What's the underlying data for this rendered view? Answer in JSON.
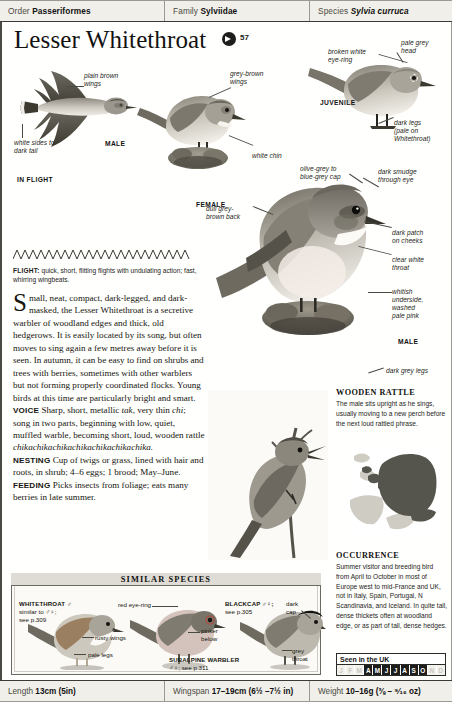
{
  "taxonomy": {
    "order_label": "Order",
    "order_value": "Passeriformes",
    "family_label": "Family",
    "family_value": "Sylviidae",
    "species_label": "Species",
    "species_value": "Sylvia curruca"
  },
  "title": "Lesser Whitethroat",
  "audio": {
    "icon": "speaker-icon",
    "track_number": "57"
  },
  "annotations": {
    "plain_brown_wings": "plain\nbrown\nwings",
    "white_sides": "white\nsides to\ndark tail",
    "male_flight": "MALE",
    "in_flight": "IN FLIGHT",
    "grey_brown_wings": "grey-brown\nwings",
    "white_chin": "white chin",
    "female": "FEMALE",
    "broken_white_eyering": "broken white\neye-ring",
    "pale_grey_head": "pale grey\nhead",
    "juvenile": "JUVENILE",
    "dark_legs": "dark legs\n(pale on\nWhitethroat)",
    "olive_grey_cap": "olive-grey to\nblue-grey cap",
    "dull_grey_back": "dull grey-\nbrown back",
    "dark_smudge": "dark smudge\nthrough eye",
    "dark_patch_cheeks": "dark patch\non cheeks",
    "clear_white_throat": "clear white\nthroat",
    "whitish_underside": "whitish\nunderside,\nwashed\npale pink",
    "male_perched": "MALE",
    "dark_grey_legs": "dark grey legs"
  },
  "flight": {
    "heading": "FLIGHT:",
    "text": " quick, short, flitting flights with undulating action; fast, whirring wingbeats."
  },
  "body": {
    "dropcap": "S",
    "intro": "mall, neat, compact, dark-legged, and dark-masked, the Lesser Whitethroat is a secretive warbler of woodland edges and thick, old hedgerows. It is easily located by its song, but often moves to sing again a few metres away before it is seen. In autumn, it can be easy to find on shrubs and trees with berries, sometimes with other warblers but not forming properly coordinated flocks. Young birds at this time are particularly bright and smart.",
    "voice_heading": "VOICE",
    "voice_a": " Sharp, short, metallic ",
    "voice_i1": "tak",
    "voice_b": ", very thin ",
    "voice_i2": "chi",
    "voice_c": "; song in two parts, beginning with low, quiet, muffled warble, becoming short, loud, wooden rattle ",
    "voice_i3": "chikachikachikachikachikachikachika.",
    "nesting_heading": "NESTING",
    "nesting": " Cup of twigs or grass, lined with hair and roots, in shrub; 4–6 eggs; 1 brood; May–June.",
    "feeding_heading": "FEEDING",
    "feeding": " Picks insects from foliage; eats many berries in late summer."
  },
  "wooden_rattle": {
    "heading": "WOODEN RATTLE",
    "text": "The male sits upright as he sings, usually moving to a new perch before the next loud rattled phrase."
  },
  "occurrence": {
    "heading": "OCCURRENCE",
    "text": "Summer visitor and breeding bird from April to October in most of Europe west to mid-France and UK, not in Italy, Spain, Portugal, N Scandinavia, and Iceland. In quite tall, dense thickets often at woodland edge, or as part of tall, dense hedges."
  },
  "seen_in_uk": {
    "heading": "Seen in the UK",
    "months": [
      {
        "label": "J",
        "active": false
      },
      {
        "label": "F",
        "active": false
      },
      {
        "label": "M",
        "active": false
      },
      {
        "label": "A",
        "active": true
      },
      {
        "label": "M",
        "active": true
      },
      {
        "label": "J",
        "active": true
      },
      {
        "label": "J",
        "active": true
      },
      {
        "label": "A",
        "active": true
      },
      {
        "label": "S",
        "active": true
      },
      {
        "label": "O",
        "active": true
      },
      {
        "label": "N",
        "active": false
      },
      {
        "label": "D",
        "active": false
      }
    ]
  },
  "similar_species": {
    "heading": "SIMILAR SPECIES",
    "items": [
      {
        "name": "WHITETHROAT ♂",
        "ref": "similar to ♂♀;\nsee p.309"
      },
      {
        "name": "BLACKCAP ♂♀;",
        "ref": "see p.305"
      },
      {
        "name": "SUBALPINE WARBLER",
        "ref": "♂♀; see p.311"
      }
    ],
    "labels": {
      "rusty_wings": "rusty wings",
      "pale_legs": "pale legs",
      "red_eyering": "red eye-ring",
      "pinker_below": "pinker\nbelow",
      "dark_cap": "dark\ncap",
      "grey_throat": "grey\nthroat"
    }
  },
  "measurements": {
    "length_label": "Length",
    "length_value": "13cm (5in)",
    "wingspan_label": "Wingspan",
    "wingspan_value": "17–19cm (6½ –7½ in)",
    "weight_label": "Weight",
    "weight_value": "10–16g (⅜ – ⁹⁄₁₆ oz)"
  },
  "colors": {
    "ink": "#1d1d1b",
    "rule": "#6a6a62",
    "panel": "#f1efe9",
    "map_range": "#55554e"
  }
}
